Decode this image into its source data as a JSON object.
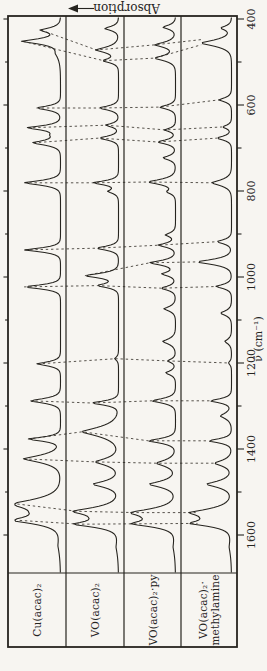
{
  "colors": {
    "paper": "#f7f5f1",
    "ink": "#26241f",
    "dotted": "#45413a"
  },
  "chart_data": {
    "type": "line",
    "orientation": "landscape figure printed rotated 90deg CCW on a portrait page",
    "xlabel": "ν̃ (cm⁻¹)",
    "ylabel": "Absorption",
    "x_axis": {
      "xlim_left_to_right": [
        1690,
        395
      ],
      "ticks": [
        400,
        600,
        800,
        1000,
        1200,
        1400,
        1600
      ],
      "minor_ticks": [
        500,
        700,
        900,
        1100,
        1300,
        1500
      ]
    },
    "peak_format": "[wavenumber_cm-1, relative_intensity_0to1, halfwidth_cm-1]",
    "panels": [
      {
        "label": "Cu(acac)₂",
        "label_lines": [
          "Cu(acac)₂",
          ""
        ],
        "peaks": [
          [
            426,
            0.42,
            8
          ],
          [
            452,
            0.8,
            9
          ],
          [
            480,
            0.1,
            18
          ],
          [
            607,
            0.52,
            7
          ],
          [
            653,
            0.7,
            7
          ],
          [
            670,
            0.16,
            11
          ],
          [
            688,
            0.58,
            8
          ],
          [
            781,
            0.78,
            8
          ],
          [
            937,
            0.76,
            7
          ],
          [
            1023,
            0.78,
            7
          ],
          [
            1202,
            0.5,
            7
          ],
          [
            1288,
            0.65,
            8
          ],
          [
            1377,
            0.7,
            7
          ],
          [
            1423,
            0.78,
            13
          ],
          [
            1528,
            0.92,
            16
          ],
          [
            1547,
            0.25,
            25
          ],
          [
            1566,
            0.87,
            12
          ],
          [
            1625,
            0.05,
            28
          ]
        ]
      },
      {
        "label": "VO(acac)₂",
        "label_lines": [
          "VO(acac)₂",
          ""
        ],
        "peaks": [
          [
            422,
            0.3,
            7
          ],
          [
            472,
            0.48,
            10
          ],
          [
            497,
            0.33,
            7
          ],
          [
            607,
            0.42,
            7
          ],
          [
            647,
            0.28,
            6
          ],
          [
            677,
            0.42,
            7
          ],
          [
            781,
            0.55,
            7
          ],
          [
            801,
            0.22,
            7
          ],
          [
            933,
            0.48,
            7
          ],
          [
            997,
            0.72,
            8
          ],
          [
            1020,
            0.45,
            7
          ],
          [
            1190,
            0.08,
            6
          ],
          [
            1293,
            0.58,
            7
          ],
          [
            1360,
            0.78,
            16
          ],
          [
            1430,
            0.5,
            12
          ],
          [
            1482,
            0.55,
            11
          ],
          [
            1545,
            0.88,
            13
          ],
          [
            1560,
            0.2,
            20
          ],
          [
            1575,
            0.82,
            10
          ],
          [
            1628,
            0.05,
            26
          ]
        ]
      },
      {
        "label": "VO(acac)₂·py",
        "label_lines": [
          "VO(acac)₂·py",
          ""
        ],
        "peaks": [
          [
            419,
            0.28,
            7
          ],
          [
            460,
            0.45,
            9
          ],
          [
            491,
            0.46,
            9
          ],
          [
            605,
            0.35,
            7
          ],
          [
            658,
            0.24,
            6
          ],
          [
            686,
            0.4,
            7
          ],
          [
            723,
            0.28,
            7
          ],
          [
            779,
            0.6,
            9
          ],
          [
            802,
            0.18,
            7
          ],
          [
            902,
            0.22,
            7
          ],
          [
            926,
            0.38,
            7
          ],
          [
            967,
            0.57,
            8
          ],
          [
            993,
            0.3,
            7
          ],
          [
            1026,
            0.32,
            7
          ],
          [
            1074,
            0.25,
            8
          ],
          [
            1150,
            0.28,
            9
          ],
          [
            1195,
            0.18,
            6
          ],
          [
            1223,
            0.22,
            7
          ],
          [
            1288,
            0.52,
            8
          ],
          [
            1381,
            0.6,
            8
          ],
          [
            1433,
            0.42,
            11
          ],
          [
            1482,
            0.58,
            11
          ],
          [
            1548,
            0.86,
            13
          ],
          [
            1560,
            0.2,
            20
          ],
          [
            1574,
            0.8,
            10
          ],
          [
            1628,
            0.05,
            26
          ]
        ]
      },
      {
        "label": "VO(acac)₂·methylamine",
        "label_lines": [
          "VO(acac)₂·",
          "methylamine"
        ],
        "peaks": [
          [
            421,
            0.24,
            7
          ],
          [
            456,
            0.68,
            11
          ],
          [
            588,
            0.28,
            7
          ],
          [
            651,
            0.2,
            6
          ],
          [
            677,
            0.33,
            7
          ],
          [
            781,
            0.44,
            10
          ],
          [
            918,
            0.33,
            7
          ],
          [
            965,
            0.77,
            9
          ],
          [
            1022,
            0.35,
            7
          ],
          [
            1084,
            0.25,
            8
          ],
          [
            1150,
            0.15,
            8
          ],
          [
            1200,
            0.07,
            6
          ],
          [
            1288,
            0.48,
            7
          ],
          [
            1323,
            0.25,
            10
          ],
          [
            1381,
            0.52,
            7
          ],
          [
            1433,
            0.38,
            10
          ],
          [
            1482,
            0.56,
            11
          ],
          [
            1548,
            0.8,
            13
          ],
          [
            1560,
            0.18,
            20
          ],
          [
            1573,
            0.76,
            10
          ],
          [
            1628,
            0.05,
            26
          ]
        ]
      }
    ],
    "correlation_lines": [
      {
        "points": [
          [
            1,
            426
          ],
          [
            2,
            472
          ],
          [
            3,
            460
          ],
          [
            4,
            448
          ]
        ]
      },
      {
        "points": [
          [
            1,
            452
          ],
          [
            2,
            497
          ],
          [
            3,
            491
          ],
          [
            4,
            460
          ]
        ]
      },
      {
        "points": [
          [
            1,
            607
          ],
          [
            2,
            607
          ],
          [
            3,
            605
          ],
          [
            4,
            588
          ]
        ]
      },
      {
        "points": [
          [
            1,
            653
          ],
          [
            2,
            647
          ],
          [
            3,
            658
          ],
          [
            4,
            651
          ]
        ]
      },
      {
        "points": [
          [
            1,
            688
          ],
          [
            2,
            677
          ],
          [
            3,
            686
          ],
          [
            4,
            677
          ]
        ]
      },
      {
        "points": [
          [
            1,
            781
          ],
          [
            2,
            781
          ],
          [
            3,
            779
          ],
          [
            4,
            781
          ]
        ]
      },
      {
        "points": [
          [
            1,
            937
          ],
          [
            2,
            933
          ],
          [
            3,
            926
          ],
          [
            4,
            918
          ]
        ]
      },
      {
        "points": [
          [
            2,
            997
          ],
          [
            3,
            967
          ],
          [
            4,
            965
          ]
        ]
      },
      {
        "points": [
          [
            1,
            1023
          ],
          [
            2,
            1020
          ],
          [
            3,
            1026
          ],
          [
            4,
            1022
          ]
        ]
      },
      {
        "points": [
          [
            1,
            1202
          ],
          [
            2,
            1190
          ],
          [
            3,
            1195
          ],
          [
            4,
            1200
          ]
        ]
      },
      {
        "points": [
          [
            1,
            1288
          ],
          [
            2,
            1293
          ],
          [
            3,
            1288
          ],
          [
            4,
            1288
          ]
        ]
      },
      {
        "points": [
          [
            1,
            1377
          ],
          [
            2,
            1360
          ],
          [
            3,
            1381
          ],
          [
            4,
            1381
          ]
        ]
      },
      {
        "points": [
          [
            1,
            1423
          ],
          [
            2,
            1430
          ],
          [
            3,
            1433
          ],
          [
            4,
            1433
          ]
        ]
      },
      {
        "points": [
          [
            1,
            1528
          ],
          [
            2,
            1545
          ],
          [
            3,
            1548
          ],
          [
            4,
            1548
          ]
        ]
      },
      {
        "points": [
          [
            1,
            1566
          ],
          [
            2,
            1575
          ],
          [
            3,
            1574
          ],
          [
            4,
            1573
          ]
        ]
      }
    ]
  }
}
